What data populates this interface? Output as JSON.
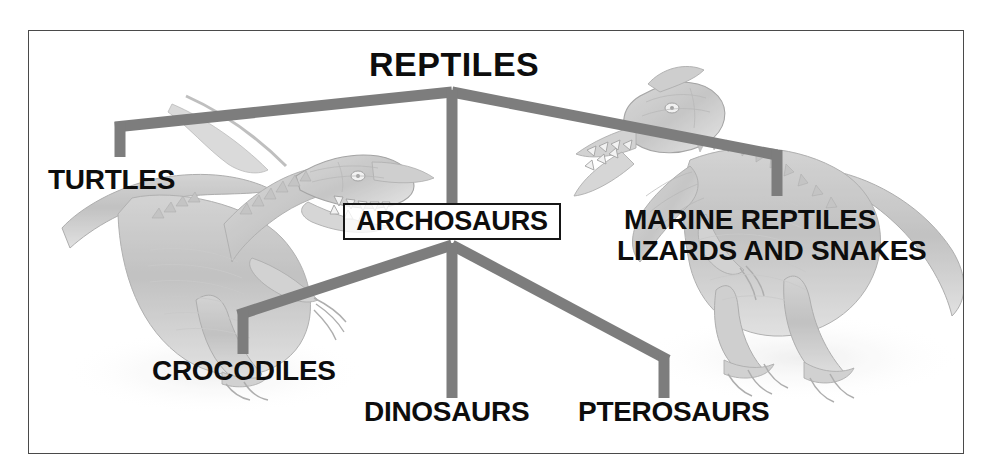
{
  "diagram": {
    "title": "REPTILES",
    "type": "cladogram",
    "border_color": "#4a4a4a",
    "connector_color": "#7d7d7d",
    "text_color": "#0d0d0d",
    "box_border_color": "#161616",
    "background_color": "#ffffff",
    "nodes": {
      "root": "REPTILES",
      "turtles": "TURTLES",
      "archosaurs": "ARCHOSAURS",
      "marine_reptiles": "MARINE REPTILES",
      "lizards_and_snakes": "LIZARDS AND SNAKES",
      "crocodiles": "CROCODILES",
      "dinosaurs": "DINOSAURS",
      "pterosaurs": "PTEROSAURS"
    },
    "artwork": [
      {
        "name": "theropod-dinosaur-left",
        "description": "grayscale pencil illustration of a roaring theropod dinosaur"
      },
      {
        "name": "theropod-dinosaur-right",
        "description": "grayscale pencil illustration of a crested theropod dinosaur"
      }
    ]
  }
}
